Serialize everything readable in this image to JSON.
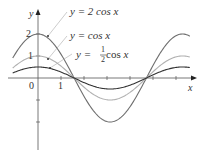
{
  "chart_data": {
    "type": "line",
    "title": "",
    "xlabel": "x",
    "ylabel": "y",
    "xlim": [
      -1.1,
      6.6
    ],
    "ylim": [
      -3.2,
      2.9
    ],
    "grid": false,
    "x_ticks": [
      1,
      2,
      3,
      4,
      5,
      6
    ],
    "x_tick_labels": [
      {
        "value": 0,
        "label": "0"
      },
      {
        "value": 1,
        "label": "1"
      }
    ],
    "y_ticks": [
      2,
      1,
      -1,
      -2
    ],
    "y_tick_labels": [
      {
        "value": 2,
        "label": "2"
      },
      {
        "value": 1,
        "label": "1"
      }
    ],
    "series": [
      {
        "name": "y = 2 cos x",
        "amplitude": 2,
        "function": "2*cos(x)",
        "color": "#6e6e6e",
        "x_range": [
          -1.1,
          6.6
        ]
      },
      {
        "name": "y = cos x",
        "amplitude": 1,
        "function": "cos(x)",
        "color": "#b0b0b0",
        "x_range": [
          -1.1,
          6.6
        ]
      },
      {
        "name": "y = 1/2 cos x",
        "amplitude": 0.5,
        "function": "0.5*cos(x)",
        "color": "#333333",
        "x_range": [
          -1.1,
          6.6
        ]
      }
    ],
    "annotations": [
      {
        "text_prefix": "y = 2 cos ",
        "var": "x",
        "points_to": "y = 2 cos x",
        "anchor_x": 0.55
      },
      {
        "text_prefix": "y = cos ",
        "var": "x",
        "points_to": "y = cos x",
        "anchor_x": 0.55
      },
      {
        "text_prefix": "y = ",
        "frac_num": "1",
        "frac_den": "2",
        "text_suffix": " cos ",
        "var": "x",
        "points_to": "y = 1/2 cos x",
        "anchor_x": 0.55
      }
    ]
  },
  "axes": {
    "x_axis_label": "x",
    "y_axis_label": "y",
    "origin_label": "0",
    "tick_label_1_x": "1",
    "tick_label_1_y": "1",
    "tick_label_2_y": "2"
  },
  "labels": {
    "two_cos": {
      "prefix": "y = 2 cos ",
      "var": "x"
    },
    "cos": {
      "prefix": "y = cos ",
      "var": "x"
    },
    "half_cos": {
      "prefix": "y = ",
      "num": "1",
      "den": "2",
      "suffix": " cos ",
      "var": "x"
    }
  }
}
